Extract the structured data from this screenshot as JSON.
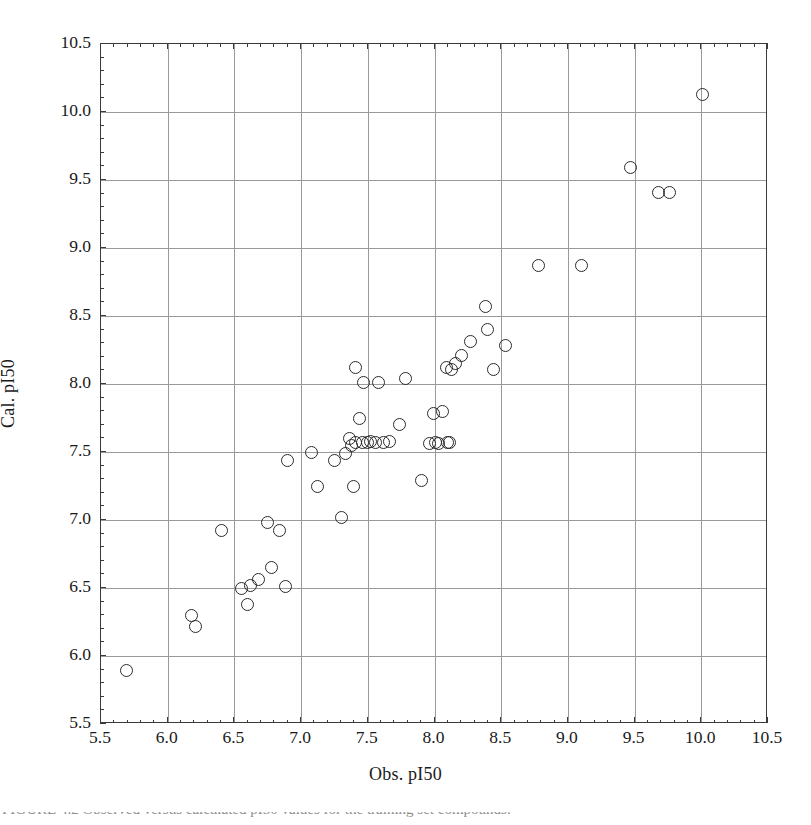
{
  "chart_data": {
    "type": "scatter",
    "title": "",
    "xlabel": "Obs. pI50",
    "ylabel": "Cal. pI50",
    "xlim": [
      5.5,
      10.5
    ],
    "ylim": [
      5.5,
      10.5
    ],
    "xticks": [
      "5.5",
      "6.0",
      "6.5",
      "7.0",
      "7.5",
      "8.0",
      "8.5",
      "9.0",
      "9.5",
      "10.0",
      "10.5"
    ],
    "yticks": [
      "5.5",
      "6.0",
      "6.5",
      "7.0",
      "7.5",
      "8.0",
      "8.5",
      "9.0",
      "9.5",
      "10.0",
      "10.5"
    ],
    "xtick_values": [
      5.5,
      6.0,
      6.5,
      7.0,
      7.5,
      8.0,
      8.5,
      9.0,
      9.5,
      10.0,
      10.5
    ],
    "ytick_values": [
      5.5,
      6.0,
      6.5,
      7.0,
      7.5,
      8.0,
      8.5,
      9.0,
      9.5,
      10.0,
      10.5
    ],
    "minor_ticks_per_interval": 5,
    "grid": true,
    "grid_color": "#9a9a9a",
    "legend": null,
    "marker": "open-circle",
    "marker_color": "#2b2b2b",
    "marker_size": 13,
    "n_points": 56,
    "x": [
      5.69,
      6.18,
      6.21,
      6.4,
      6.55,
      6.6,
      6.62,
      6.68,
      6.75,
      6.78,
      6.84,
      6.88,
      6.9,
      7.08,
      7.12,
      7.25,
      7.3,
      7.33,
      7.36,
      7.38,
      7.39,
      7.41,
      7.41,
      7.44,
      7.46,
      7.47,
      7.5,
      7.52,
      7.56,
      7.58,
      7.62,
      7.66,
      7.74,
      7.78,
      7.9,
      7.96,
      7.99,
      8.01,
      8.03,
      8.06,
      8.09,
      8.1,
      8.11,
      8.13,
      8.16,
      8.2,
      8.27,
      8.38,
      8.4,
      8.44,
      8.53,
      8.78,
      9.1,
      9.47,
      9.68,
      9.76,
      10.01
    ],
    "y": [
      5.89,
      6.3,
      6.22,
      6.92,
      6.5,
      6.38,
      6.52,
      6.56,
      6.98,
      6.65,
      6.92,
      6.51,
      7.44,
      7.5,
      7.25,
      7.44,
      7.02,
      7.49,
      7.6,
      7.55,
      7.25,
      8.12,
      7.57,
      7.75,
      7.57,
      8.01,
      7.57,
      7.58,
      7.57,
      8.01,
      7.57,
      7.58,
      7.7,
      8.04,
      7.29,
      7.56,
      7.78,
      7.57,
      7.56,
      7.8,
      8.12,
      7.57,
      7.57,
      8.11,
      8.15,
      8.21,
      8.31,
      8.57,
      8.4,
      8.11,
      8.28,
      8.87,
      8.87,
      9.59,
      9.41,
      9.41,
      10.13
    ],
    "points": [
      {
        "x": 5.69,
        "y": 5.89
      },
      {
        "x": 6.18,
        "y": 6.3
      },
      {
        "x": 6.21,
        "y": 6.22
      },
      {
        "x": 6.4,
        "y": 6.92
      },
      {
        "x": 6.55,
        "y": 6.5
      },
      {
        "x": 6.6,
        "y": 6.38
      },
      {
        "x": 6.62,
        "y": 6.52
      },
      {
        "x": 6.68,
        "y": 6.56
      },
      {
        "x": 6.75,
        "y": 6.98
      },
      {
        "x": 6.78,
        "y": 6.65
      },
      {
        "x": 6.84,
        "y": 6.92
      },
      {
        "x": 6.88,
        "y": 6.51
      },
      {
        "x": 6.9,
        "y": 7.44
      },
      {
        "x": 7.08,
        "y": 7.5
      },
      {
        "x": 7.12,
        "y": 7.25
      },
      {
        "x": 7.25,
        "y": 7.44
      },
      {
        "x": 7.3,
        "y": 7.02
      },
      {
        "x": 7.33,
        "y": 7.49
      },
      {
        "x": 7.36,
        "y": 7.6
      },
      {
        "x": 7.38,
        "y": 7.55
      },
      {
        "x": 7.39,
        "y": 7.25
      },
      {
        "x": 7.41,
        "y": 8.12
      },
      {
        "x": 7.41,
        "y": 7.57
      },
      {
        "x": 7.44,
        "y": 7.75
      },
      {
        "x": 7.46,
        "y": 7.57
      },
      {
        "x": 7.47,
        "y": 8.01
      },
      {
        "x": 7.5,
        "y": 7.57
      },
      {
        "x": 7.52,
        "y": 7.58
      },
      {
        "x": 7.56,
        "y": 7.57
      },
      {
        "x": 7.58,
        "y": 8.01
      },
      {
        "x": 7.62,
        "y": 7.57
      },
      {
        "x": 7.66,
        "y": 7.58
      },
      {
        "x": 7.74,
        "y": 7.7
      },
      {
        "x": 7.78,
        "y": 8.04
      },
      {
        "x": 7.9,
        "y": 7.29
      },
      {
        "x": 7.96,
        "y": 7.56
      },
      {
        "x": 7.99,
        "y": 7.78
      },
      {
        "x": 8.01,
        "y": 7.57
      },
      {
        "x": 8.03,
        "y": 7.56
      },
      {
        "x": 8.06,
        "y": 7.8
      },
      {
        "x": 8.09,
        "y": 8.12
      },
      {
        "x": 8.1,
        "y": 7.57
      },
      {
        "x": 8.11,
        "y": 7.57
      },
      {
        "x": 8.13,
        "y": 8.11
      },
      {
        "x": 8.16,
        "y": 8.15
      },
      {
        "x": 8.2,
        "y": 8.21
      },
      {
        "x": 8.27,
        "y": 8.31
      },
      {
        "x": 8.38,
        "y": 8.57
      },
      {
        "x": 8.4,
        "y": 8.4
      },
      {
        "x": 8.44,
        "y": 8.11
      },
      {
        "x": 8.53,
        "y": 8.28
      },
      {
        "x": 8.78,
        "y": 8.87
      },
      {
        "x": 9.1,
        "y": 8.87
      },
      {
        "x": 9.47,
        "y": 9.59
      },
      {
        "x": 9.68,
        "y": 9.41
      },
      {
        "x": 9.76,
        "y": 9.41
      },
      {
        "x": 10.01,
        "y": 10.13
      }
    ]
  },
  "figure": {
    "caption_sliver": "FIGURE 4.2   Observed versus calculated pI50 values for the training set compounds."
  }
}
